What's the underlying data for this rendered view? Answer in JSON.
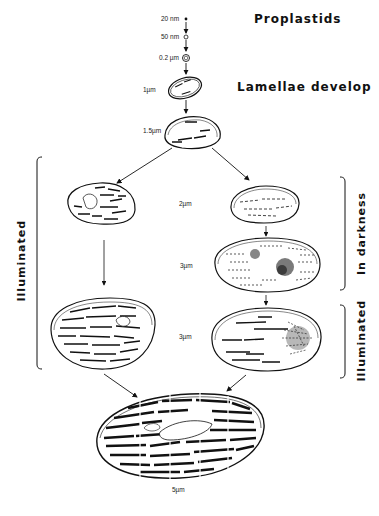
{
  "diagram": {
    "headings": {
      "proplastids": "Proplastids",
      "lamellae_develop": "Lamellae develop"
    },
    "size_labels": {
      "s20nm": "20 nm",
      "s50nm": "50 nm",
      "s02um": "0.2 µm",
      "s1um": "1µm",
      "s15um": "1.5µm",
      "s2um": "2µm",
      "s3um": "3µm",
      "s3um_b": "3µm",
      "s5um": "5µm"
    },
    "brackets": {
      "left": "Illuminated",
      "right_top": "In darkness",
      "right_bottom": "Illuminated"
    },
    "colors": {
      "ink": "#111111",
      "background": "#ffffff"
    }
  }
}
